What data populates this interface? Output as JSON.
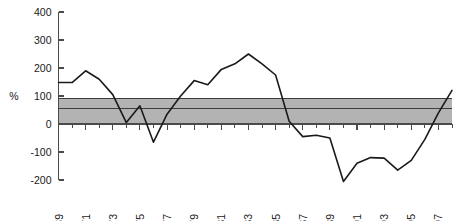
{
  "chart_data": {
    "type": "line",
    "title": "",
    "xlabel": "",
    "ylabel": "%",
    "ylim": [
      -200,
      400
    ],
    "xlim": [
      1969,
      1998
    ],
    "yticks": [
      400,
      300,
      200,
      100,
      0,
      -100,
      -200
    ],
    "ytick_labels": [
      "400",
      "300",
      "200",
      "100",
      "0",
      "-100",
      "-200"
    ],
    "xticks": [
      1969,
      1971,
      1973,
      1975,
      1977,
      1979,
      1981,
      1983,
      1985,
      1987,
      1989,
      1991,
      1993,
      1995,
      1997
    ],
    "xtick_labels": [
      "1969",
      "1971",
      "1973",
      "1975",
      "1977",
      "1979",
      "1981",
      "1983",
      "1985",
      "1987",
      "1989",
      "1991",
      "1993",
      "1995",
      "1997"
    ],
    "minor_xticks": [
      1970,
      1972,
      1974,
      1976,
      1978,
      1980,
      1982,
      1984,
      1986,
      1988,
      1990,
      1992,
      1994,
      1996,
      1998
    ],
    "grid": false,
    "legend": "none",
    "xtick_label_rotation": -90,
    "bands": [
      {
        "name": "reference-band",
        "y_low": 0,
        "y_high": 90,
        "fill_color": "#b3b3b3",
        "edge_color": "#3d3d3d",
        "mid_line_value": 55
      }
    ],
    "series": [
      {
        "name": "series-1",
        "color": "#1a1a1a",
        "x": [
          1969,
          1970,
          1971,
          1972,
          1973,
          1974,
          1975,
          1976,
          1977,
          1978,
          1979,
          1980,
          1981,
          1982,
          1983,
          1984,
          1985,
          1986,
          1987,
          1988,
          1989,
          1990,
          1991,
          1992,
          1993,
          1994,
          1995,
          1996,
          1997,
          1998
        ],
        "values": [
          148,
          148,
          190,
          160,
          105,
          5,
          65,
          -65,
          35,
          100,
          155,
          140,
          195,
          215,
          250,
          215,
          175,
          10,
          -45,
          -40,
          -50,
          -205,
          -140,
          -120,
          -122,
          -165,
          -130,
          -55,
          40,
          120
        ]
      }
    ]
  }
}
